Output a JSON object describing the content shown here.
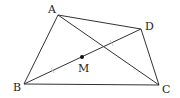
{
  "diagram": {
    "type": "quadrilateral-with-diagonals",
    "line_color": "#333333",
    "tick_color": "#bbbbbb",
    "points": {
      "A": {
        "label": "A",
        "x": 58,
        "y": 15,
        "lx": 48,
        "ly": 13
      },
      "B": {
        "label": "B",
        "x": 24,
        "y": 84,
        "lx": 13,
        "ly": 91
      },
      "C": {
        "label": "C",
        "x": 159,
        "y": 85,
        "lx": 162,
        "ly": 93
      },
      "D": {
        "label": "D",
        "x": 141,
        "y": 29,
        "lx": 145,
        "ly": 30
      },
      "M": {
        "label": "M",
        "x": 82,
        "y": 57,
        "lx": 78,
        "ly": 72
      }
    },
    "segments": [
      "AB",
      "BC",
      "CD",
      "DA",
      "AC",
      "BD"
    ],
    "equal_marks": [
      "BM",
      "MD"
    ]
  }
}
